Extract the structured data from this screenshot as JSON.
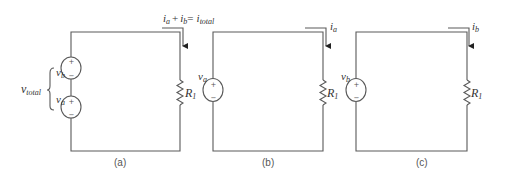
{
  "figure": {
    "circuits": [
      {
        "id": "a",
        "caption": "(a)",
        "sources": [
          {
            "name": "v",
            "sub": "b",
            "plus": "+",
            "minus": "−"
          },
          {
            "name": "v",
            "sub": "a",
            "plus": "+",
            "minus": "−"
          }
        ],
        "brace_label": {
          "name": "v",
          "sub": "total"
        },
        "resistor": {
          "name": "R",
          "sub": "1"
        },
        "current_label": {
          "i1": "i",
          "i1_sub": "a",
          "plus": "+",
          "i2": "i",
          "i2_sub": "b",
          "eq": "=",
          "i3": "i",
          "i3_sub": "total"
        }
      },
      {
        "id": "b",
        "caption": "(b)",
        "sources": [
          {
            "name": "v",
            "sub": "a",
            "plus": "+",
            "minus": "−"
          }
        ],
        "resistor": {
          "name": "R",
          "sub": "1"
        },
        "current_label": {
          "name": "i",
          "sub": "a"
        }
      },
      {
        "id": "c",
        "caption": "(c)",
        "sources": [
          {
            "name": "v",
            "sub": "b",
            "plus": "+",
            "minus": "−"
          }
        ],
        "resistor": {
          "name": "R",
          "sub": "1"
        },
        "current_label": {
          "name": "i",
          "sub": "b"
        }
      }
    ],
    "colors": {
      "wire": "#5a5a5a",
      "text": "#333333",
      "background": "#ffffff"
    }
  }
}
